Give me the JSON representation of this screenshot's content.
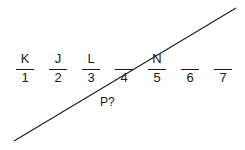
{
  "diagram": {
    "slots": [
      {
        "position": "1",
        "letter": "K"
      },
      {
        "position": "2",
        "letter": "J"
      },
      {
        "position": "3",
        "letter": "L"
      },
      {
        "position": "4",
        "letter": ""
      },
      {
        "position": "5",
        "letter": "N"
      },
      {
        "position": "6",
        "letter": ""
      },
      {
        "position": "7",
        "letter": ""
      }
    ],
    "annotation": "P?",
    "diagonal_line": {
      "from": [
        14,
        141
      ],
      "to": [
        236,
        8
      ],
      "color": "#1a1a1a"
    }
  }
}
